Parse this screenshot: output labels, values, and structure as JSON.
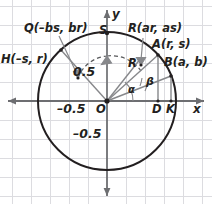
{
  "figure": {
    "type": "unit-circle-diagram",
    "background": "#ffffff",
    "grid_color": "#d9d9dd",
    "axis_color": "#6d6e71",
    "circle_color": "#231f20",
    "segment_color": "#808285",
    "text_color": "#231f20",
    "grid_spacing_px": 19,
    "origin_px": {
      "x": 107,
      "y": 101
    },
    "radius_px": 69
  },
  "axes": {
    "x_label": "x",
    "y_label": "y",
    "ticks": {
      "x_negative": "–0.5",
      "y_positive": "0.5",
      "y_negative": "–0.5"
    }
  },
  "points": {
    "origin": {
      "label": "O",
      "x": 0,
      "y": 0
    },
    "S": {
      "label": "S",
      "x": 0,
      "y": 1
    },
    "A": {
      "label": "A(r, s)",
      "short": "A",
      "x": 0.74,
      "y": 0.67
    },
    "B": {
      "label": "B(a, b)",
      "short": "B",
      "x": 0.93,
      "y": 0.37
    },
    "R": {
      "label": "R(ar, as)",
      "short": "R",
      "x": 0.5,
      "y": 0.62
    },
    "Q": {
      "label": "Q(–bs, br)",
      "short": "Q",
      "x": -0.41,
      "y": 0.33
    },
    "H": {
      "label": "H(–s, r)",
      "short": "H",
      "x": -0.67,
      "y": 0.74
    },
    "D": {
      "label": "D",
      "x": 0.74,
      "y": 0
    },
    "K": {
      "label": "K",
      "x": 0.93,
      "y": 0
    }
  },
  "angles": {
    "alpha": {
      "label": "α",
      "vertex": "O",
      "between": [
        "x-axis",
        "OA"
      ]
    },
    "beta": {
      "label": "β",
      "vertex": "O",
      "between": [
        "OA",
        "OB"
      ]
    }
  },
  "segments": [
    {
      "name": "OA",
      "from": "O",
      "to": "A"
    },
    {
      "name": "OB",
      "from": "O",
      "to": "B"
    },
    {
      "name": "OR",
      "from": "O",
      "to": "R"
    },
    {
      "name": "OH",
      "from": "O",
      "to": "H"
    },
    {
      "name": "OS",
      "from": "O",
      "to": "S"
    },
    {
      "name": "AD",
      "from": "A",
      "to": "D"
    },
    {
      "name": "BK",
      "from": "B",
      "to": "K"
    }
  ],
  "arcs": [
    {
      "name": "arc-Q-S",
      "style": "dashed",
      "from": "Q",
      "to": "S"
    },
    {
      "name": "arc-S-R",
      "style": "dashed",
      "from": "S",
      "to": "R"
    }
  ],
  "leaders": [
    {
      "name": "leader-Q",
      "from_label": "Q(–bs, br)",
      "to_point": "Q"
    },
    {
      "name": "leader-R",
      "from_label": "R(ar, as)",
      "to_point": "R"
    }
  ]
}
